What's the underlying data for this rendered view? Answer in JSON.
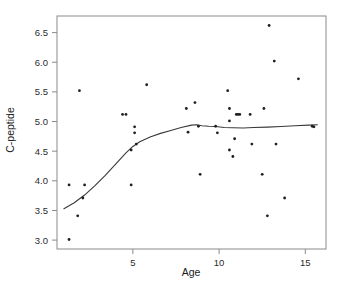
{
  "chart_data": {
    "type": "scatter",
    "title": "",
    "xlabel": "Age",
    "ylabel": "C-peptide",
    "xlim": [
      0.6,
      16.2
    ],
    "ylim": [
      2.85,
      6.78
    ],
    "xticks": [
      5,
      10,
      15
    ],
    "xtick_labels": [
      "5",
      "10",
      "15"
    ],
    "yticks": [
      3.0,
      3.5,
      4.0,
      4.5,
      5.0,
      5.5,
      6.0,
      6.5
    ],
    "ytick_labels": [
      "3.0",
      "3.5",
      "4.0",
      "4.5",
      "5.0",
      "5.5",
      "6.0",
      "6.5"
    ],
    "grid": false,
    "legend": null,
    "marker": "dot",
    "point_color": "#1f1f1f",
    "curve_color": "#3a3a3a",
    "frame_color": "#8a8a8a",
    "background": "#ffffff",
    "points": [
      {
        "x": 1.3,
        "y": 3.93
      },
      {
        "x": 1.3,
        "y": 3.01
      },
      {
        "x": 1.9,
        "y": 5.52
      },
      {
        "x": 2.2,
        "y": 3.93
      },
      {
        "x": 2.1,
        "y": 3.71
      },
      {
        "x": 1.8,
        "y": 3.41
      },
      {
        "x": 4.4,
        "y": 5.12
      },
      {
        "x": 4.6,
        "y": 5.12
      },
      {
        "x": 4.9,
        "y": 3.93
      },
      {
        "x": 5.1,
        "y": 4.91
      },
      {
        "x": 5.1,
        "y": 4.81
      },
      {
        "x": 5.2,
        "y": 4.62
      },
      {
        "x": 4.9,
        "y": 4.52
      },
      {
        "x": 5.8,
        "y": 5.62
      },
      {
        "x": 8.1,
        "y": 5.22
      },
      {
        "x": 8.2,
        "y": 4.82
      },
      {
        "x": 8.6,
        "y": 5.32
      },
      {
        "x": 8.8,
        "y": 4.92
      },
      {
        "x": 8.9,
        "y": 4.11
      },
      {
        "x": 9.8,
        "y": 4.92
      },
      {
        "x": 9.9,
        "y": 4.81
      },
      {
        "x": 10.5,
        "y": 5.52
      },
      {
        "x": 10.6,
        "y": 5.22
      },
      {
        "x": 10.6,
        "y": 5.01
      },
      {
        "x": 10.6,
        "y": 4.52
      },
      {
        "x": 10.8,
        "y": 4.41
      },
      {
        "x": 11.0,
        "y": 5.12
      },
      {
        "x": 11.1,
        "y": 5.12
      },
      {
        "x": 11.2,
        "y": 5.12
      },
      {
        "x": 10.9,
        "y": 4.71
      },
      {
        "x": 11.8,
        "y": 5.12
      },
      {
        "x": 11.9,
        "y": 4.62
      },
      {
        "x": 12.6,
        "y": 5.22
      },
      {
        "x": 12.5,
        "y": 4.11
      },
      {
        "x": 12.8,
        "y": 3.41
      },
      {
        "x": 12.9,
        "y": 6.62
      },
      {
        "x": 13.2,
        "y": 6.02
      },
      {
        "x": 13.3,
        "y": 4.62
      },
      {
        "x": 13.8,
        "y": 3.71
      },
      {
        "x": 14.6,
        "y": 5.72
      },
      {
        "x": 15.4,
        "y": 4.92
      },
      {
        "x": 15.5,
        "y": 4.91
      }
    ],
    "fit_curve": {
      "name": "smooth-fit",
      "x": [
        1.0,
        1.6,
        2.2,
        2.8,
        3.4,
        4.0,
        4.6,
        5.0,
        5.4,
        6.0,
        6.6,
        7.2,
        7.8,
        8.4,
        8.7,
        9.0,
        9.4,
        9.8,
        10.3,
        10.8,
        11.4,
        12.0,
        12.8,
        13.6,
        14.4,
        15.2,
        15.7
      ],
      "y": [
        3.53,
        3.63,
        3.76,
        3.92,
        4.09,
        4.28,
        4.47,
        4.58,
        4.66,
        4.74,
        4.8,
        4.85,
        4.9,
        4.94,
        4.945,
        4.93,
        4.92,
        4.915,
        4.9,
        4.895,
        4.89,
        4.9,
        4.905,
        4.915,
        4.93,
        4.94,
        4.945
      ]
    }
  },
  "axis": {
    "x_title": "Age",
    "y_title": "C-peptide"
  }
}
